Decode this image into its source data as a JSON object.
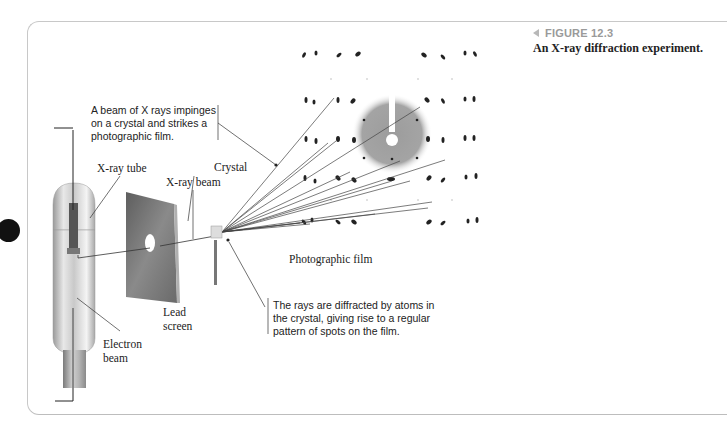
{
  "figure": {
    "number_label": "FIGURE 12.3",
    "caption": "An X-ray diffraction experiment.",
    "accent_color": "#9a9a9a"
  },
  "callouts": {
    "top_note": [
      "A beam of X rays impinges",
      "on a crystal and strikes a",
      "photographic film."
    ],
    "bottom_note": [
      "The rays are diffracted by atoms in",
      "the crystal, giving rise to a regular",
      "pattern of spots on the film."
    ]
  },
  "labels": {
    "xray_tube": "X-ray tube",
    "xray_beam": "X-ray beam",
    "crystal": "Crystal",
    "lead_screen_line1": "Lead",
    "lead_screen_line2": "screen",
    "electron_beam_line1": "Electron",
    "electron_beam_line2": "beam",
    "photographic_film": "Photographic film"
  }
}
